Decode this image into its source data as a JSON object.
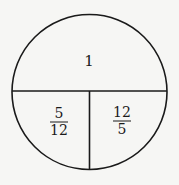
{
  "diagram": {
    "shape": "circle divided into three regions",
    "stroke_color": "#1a1a1a",
    "background": "#f6f6f4",
    "regions": [
      {
        "position": "top",
        "label": "1"
      },
      {
        "position": "bottom-left",
        "numerator": "5",
        "denominator": "12"
      },
      {
        "position": "bottom-right",
        "numerator": "12",
        "denominator": "5"
      }
    ]
  }
}
